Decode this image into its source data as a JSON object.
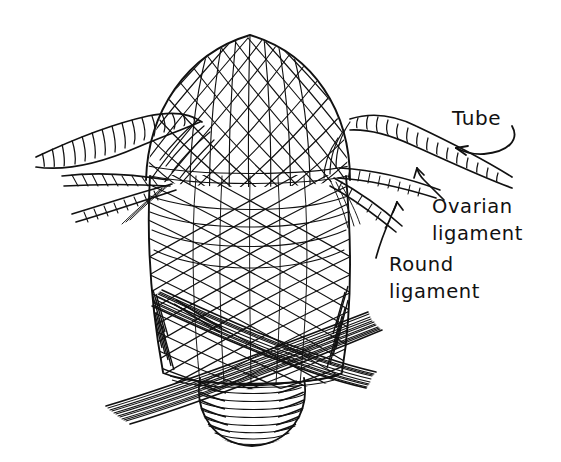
{
  "figure": {
    "style": "black-and-white pen-and-ink line drawing",
    "background_color": "#ffffff",
    "ink_color": "#111111",
    "width": 561,
    "height": 462
  },
  "labels": [
    {
      "id": "tube",
      "text": "Tube",
      "x": 452,
      "y": 125,
      "lines": [
        "Tube"
      ],
      "leader": "curved-arrow",
      "points_to": "right-fallopian-tube"
    },
    {
      "id": "ovarian-ligament",
      "text": "Ovarian ligament",
      "x": 432,
      "y": 213,
      "lines": [
        "Ovarian",
        "ligament"
      ],
      "leader": "curved-arrow",
      "points_to": "right-ovarian-ligament"
    },
    {
      "id": "round-ligament",
      "text": "Round ligament",
      "x": 389,
      "y": 260,
      "lines": [
        "Round",
        "ligament"
      ],
      "leader": "curved-arrow",
      "points_to": "right-round-ligament"
    }
  ],
  "structures": [
    {
      "id": "uterine-fundus",
      "name": "Uterine fundus",
      "description": "broad domed top with criss-cross muscle fibre mesh"
    },
    {
      "id": "uterine-body",
      "name": "Uterine body (corpus)",
      "description": "tapering barrel of interlacing oblique myometrial fibres"
    },
    {
      "id": "cervix",
      "name": "Cervix",
      "description": "rounded knob at base with concentric circular fibres"
    },
    {
      "id": "left-fallopian-tube",
      "name": "Left fallopian tube",
      "description": "laterally sweeping tube with transverse ring hatching"
    },
    {
      "id": "right-fallopian-tube",
      "name": "Right fallopian tube",
      "description": "laterally sweeping tube with transverse ring hatching"
    },
    {
      "id": "left-round-ligament",
      "name": "Left round ligament",
      "description": "twisted cord below the left tube"
    },
    {
      "id": "right-round-ligament",
      "name": "Right round ligament",
      "description": "twisted cord below the right tube"
    },
    {
      "id": "left-ovarian-ligament",
      "name": "Left ovarian ligament",
      "description": "short fibrous band beneath the left tube"
    },
    {
      "id": "right-ovarian-ligament",
      "name": "Right ovarian ligament",
      "description": "short fibrous band beneath the right tube"
    },
    {
      "id": "crossing-band-left",
      "name": "Crossing ligament band (left to right)",
      "description": "broad striated band sweeping across the cervix"
    },
    {
      "id": "crossing-band-right",
      "name": "Crossing ligament band (right to left)",
      "description": "broad striated band sweeping across the cervix"
    }
  ],
  "geometry": {
    "fundus_apex_y": 34,
    "body_left_x": 150,
    "body_right_x": 345,
    "cervix_center_x": 252,
    "cervix_center_y": 404,
    "tube_left_tip_x": 34,
    "tube_right_tip_x": 512
  }
}
